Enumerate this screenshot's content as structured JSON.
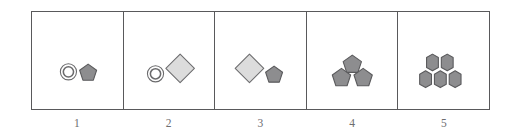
{
  "figure": {
    "name": "shape-sequence-panels",
    "panel_count": 5,
    "border_color": "#59595b",
    "background_color": "#ffffff",
    "label_color": "#6d6d6f"
  },
  "palette": {
    "pentagon_fill": "#8d8d8f",
    "pentagon_stroke": "#5a5a5c",
    "diamond_fill": "#dcdcdc",
    "diamond_stroke": "#6e6e70",
    "ring_fill": "#ffffff",
    "ring_stroke": "#6b6b6d",
    "hexagon_fill": "#8d8d8f",
    "hexagon_stroke": "#5a5a5c"
  },
  "panels": [
    {
      "label": "1",
      "name": "panel-1",
      "shape_summary": "ring and pentagon",
      "shape_count": 2,
      "shapes": [
        {
          "type": "ring",
          "name": "ring-shape",
          "size": "small",
          "position": "left"
        },
        {
          "type": "pentagon",
          "name": "pentagon-shape",
          "size": "small",
          "position": "right"
        }
      ]
    },
    {
      "label": "2",
      "name": "panel-2",
      "shape_summary": "ring and large diamond",
      "shape_count": 2,
      "shapes": [
        {
          "type": "ring",
          "name": "ring-shape",
          "size": "small",
          "position": "left"
        },
        {
          "type": "diamond",
          "name": "diamond-shape",
          "size": "large",
          "position": "right"
        }
      ]
    },
    {
      "label": "3",
      "name": "panel-3",
      "shape_summary": "large diamond and pentagon",
      "shape_count": 2,
      "shapes": [
        {
          "type": "diamond",
          "name": "diamond-shape",
          "size": "large",
          "position": "left"
        },
        {
          "type": "pentagon",
          "name": "pentagon-shape",
          "size": "small",
          "position": "right"
        }
      ]
    },
    {
      "label": "4",
      "name": "panel-4",
      "shape_summary": "three pentagons in a triangular cluster",
      "shape_count": 3,
      "shapes": [
        {
          "type": "pentagon",
          "name": "pentagon-shape",
          "size": "small",
          "position": "top-center"
        },
        {
          "type": "pentagon",
          "name": "pentagon-shape",
          "size": "small",
          "position": "bottom-left"
        },
        {
          "type": "pentagon",
          "name": "pentagon-shape",
          "size": "small",
          "position": "bottom-right"
        }
      ]
    },
    {
      "label": "5",
      "name": "panel-5",
      "shape_summary": "five rounded hexagons stacked two over three",
      "shape_count": 5,
      "shapes": [
        {
          "type": "hexagon",
          "name": "hexagon-shape",
          "size": "small",
          "position": "top-left"
        },
        {
          "type": "hexagon",
          "name": "hexagon-shape",
          "size": "small",
          "position": "top-right"
        },
        {
          "type": "hexagon",
          "name": "hexagon-shape",
          "size": "small",
          "position": "bottom-left"
        },
        {
          "type": "hexagon",
          "name": "hexagon-shape",
          "size": "small",
          "position": "bottom-center"
        },
        {
          "type": "hexagon",
          "name": "hexagon-shape",
          "size": "small",
          "position": "bottom-right"
        }
      ]
    }
  ]
}
